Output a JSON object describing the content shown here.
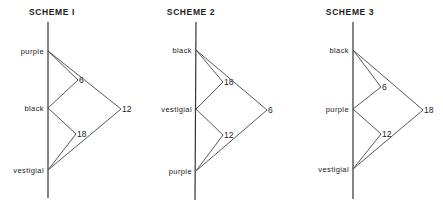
{
  "schemes": [
    {
      "title": "SCHEME I",
      "axis": {
        "x": 48,
        "y1": 22,
        "y2": 198
      },
      "title_pos": {
        "x": 52,
        "y": 15
      },
      "genes": [
        {
          "name": "purple",
          "y": 51
        },
        {
          "name": "black",
          "y": 108
        },
        {
          "name": "vestigial",
          "y": 170
        }
      ],
      "distances": [
        {
          "value": "6",
          "between": [
            "purple",
            "black"
          ],
          "vx": 78,
          "vy": 80
        },
        {
          "value": "18",
          "between": [
            "black",
            "vestigial"
          ],
          "vx": 76,
          "vy": 134
        },
        {
          "value": "12",
          "between": [
            "purple",
            "vestigial"
          ],
          "vx": 121,
          "vy": 109
        }
      ]
    },
    {
      "title": "SCHEME 2",
      "axis": {
        "x": 196,
        "y1": 22,
        "y2": 200
      },
      "title_pos": {
        "x": 191,
        "y": 15
      },
      "genes": [
        {
          "name": "black",
          "y": 50
        },
        {
          "name": "vestigial",
          "y": 109
        },
        {
          "name": "purple",
          "y": 171
        }
      ],
      "distances": [
        {
          "value": "18",
          "between": [
            "black",
            "vestigial"
          ],
          "vx": 223,
          "vy": 82
        },
        {
          "value": "12",
          "between": [
            "vestigial",
            "purple"
          ],
          "vx": 223,
          "vy": 135
        },
        {
          "value": "6",
          "between": [
            "black",
            "purple"
          ],
          "vx": 267,
          "vy": 110
        }
      ]
    },
    {
      "title": "SCHEME 3",
      "axis": {
        "x": 353,
        "y1": 22,
        "y2": 199
      },
      "title_pos": {
        "x": 350,
        "y": 15
      },
      "genes": [
        {
          "name": "black",
          "y": 50
        },
        {
          "name": "purple",
          "y": 109
        },
        {
          "name": "vestigial",
          "y": 169
        }
      ],
      "distances": [
        {
          "value": "6",
          "between": [
            "black",
            "purple"
          ],
          "vx": 381,
          "vy": 87
        },
        {
          "value": "12",
          "between": [
            "purple",
            "vestigial"
          ],
          "vx": 381,
          "vy": 134
        },
        {
          "value": "18",
          "between": [
            "black",
            "vestigial"
          ],
          "vx": 423,
          "vy": 110
        }
      ]
    }
  ],
  "colors": {
    "line": "#444444",
    "text": "#222222",
    "background": "#ffffff"
  }
}
